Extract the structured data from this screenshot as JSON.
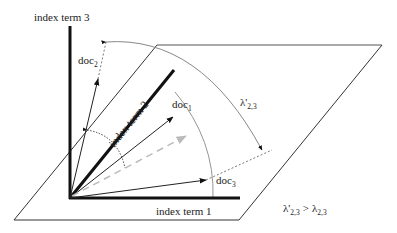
{
  "diagram": {
    "axes": {
      "term1": "index term 1",
      "term2": "index term 2",
      "term3": "index term 3"
    },
    "documents": [
      {
        "name": "doc",
        "sub": "1"
      },
      {
        "name": "doc",
        "sub": "2"
      },
      {
        "name": "doc",
        "sub": "3"
      }
    ],
    "angle_label": {
      "symbol": "λ'",
      "sub": "2,3"
    },
    "relation": {
      "left_symbol": "λ'",
      "left_sub": "2,3",
      "op": ">",
      "right_symbol": "λ",
      "right_sub": "2,3"
    },
    "colors": {
      "axis": "#111111",
      "vector": "#222222",
      "plane": "#333333",
      "arc": "#888888",
      "projected_vector": "#bbbbbb"
    }
  }
}
